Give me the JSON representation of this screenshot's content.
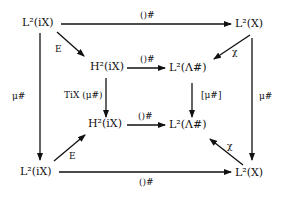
{
  "diagram": {
    "type": "commutative-diagram",
    "nodes": {
      "tl": "L²(iX)",
      "tr": "L²(X)",
      "mtl": "H²(iX)",
      "mtr": "L²(Λ#)",
      "mbl": "H²(iX)",
      "mbr": "L²(Λ#)",
      "bl": "L²(iX)",
      "br": "L²(X)"
    },
    "labels": {
      "top": "()#",
      "bottom": "()#",
      "inner_top": "()#",
      "inner_bottom": "()#",
      "left": "μ#",
      "right": "μ#",
      "inner_left": "TiX (μ#)",
      "inner_right": "[μ#]",
      "diag_tl": "E",
      "diag_bl": "E",
      "diag_tr": "χ",
      "diag_br": "χ"
    },
    "edges": [
      {
        "from": "tl",
        "to": "tr",
        "label": "()#"
      },
      {
        "from": "tl",
        "to": "mtl",
        "label": "E"
      },
      {
        "from": "tr",
        "to": "mtr",
        "label": "χ"
      },
      {
        "from": "mtl",
        "to": "mtr",
        "label": "()#"
      },
      {
        "from": "tl",
        "to": "bl",
        "label": "μ#"
      },
      {
        "from": "tr",
        "to": "br",
        "label": "μ#"
      },
      {
        "from": "mtl",
        "to": "mbl",
        "label": "TiX (μ#)"
      },
      {
        "from": "mtr",
        "to": "mbr",
        "label": "[μ#]"
      },
      {
        "from": "mbl",
        "to": "mbr",
        "label": "()#"
      },
      {
        "from": "bl",
        "to": "mbl",
        "label": "E"
      },
      {
        "from": "br",
        "to": "mbr",
        "label": "χ"
      },
      {
        "from": "bl",
        "to": "br",
        "label": "()#"
      }
    ]
  }
}
